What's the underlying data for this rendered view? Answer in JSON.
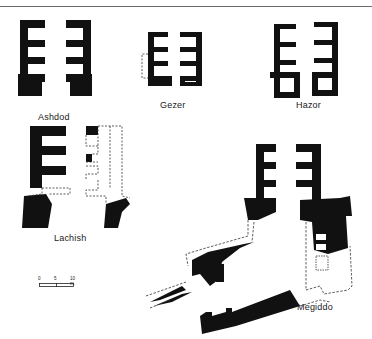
{
  "figure": {
    "header_rule": true,
    "plans": [
      {
        "id": "ashdod",
        "label": "Ashdod"
      },
      {
        "id": "gezer",
        "label": "Gezer"
      },
      {
        "id": "hazor",
        "label": "Hazor"
      },
      {
        "id": "lachish",
        "label": "Lachish"
      },
      {
        "id": "megiddo",
        "label": "Megiddo"
      }
    ],
    "scale_bar": {
      "ticks": [
        "0",
        "5",
        "10 m."
      ]
    },
    "colors": {
      "wall": "#111111",
      "reconstructed_line": "#333333",
      "background": "#ffffff"
    }
  }
}
